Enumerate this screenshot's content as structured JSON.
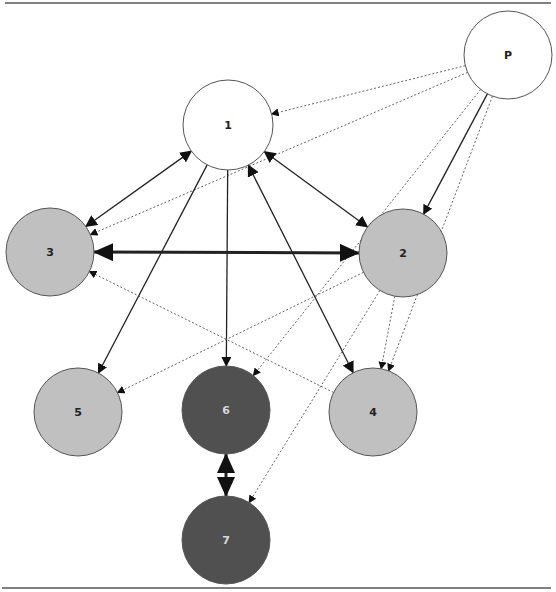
{
  "diagram": {
    "title": "",
    "frame": {
      "top_rule_y": 3,
      "bottom_rule_y": 588,
      "rule_color": "#808080"
    },
    "colors": {
      "white_fill": "#ffffff",
      "light_fill": "#c0c0c0",
      "dark_fill": "#505050",
      "stroke": "#555555",
      "edge": "#222222",
      "dotted_edge": "#666666",
      "light_label": "#222222",
      "dark_label": "#d8d8d8"
    },
    "nodes": [
      {
        "id": "P",
        "label": "P",
        "cx": 508,
        "cy": 55,
        "r": 44,
        "fill": "white"
      },
      {
        "id": "1",
        "label": "1",
        "cx": 228,
        "cy": 125,
        "r": 45,
        "fill": "white"
      },
      {
        "id": "3",
        "label": "3",
        "cx": 50,
        "cy": 252,
        "r": 44,
        "fill": "light"
      },
      {
        "id": "2",
        "label": "2",
        "cx": 403,
        "cy": 253,
        "r": 44,
        "fill": "light"
      },
      {
        "id": "5",
        "label": "5",
        "cx": 78,
        "cy": 412,
        "r": 44,
        "fill": "light"
      },
      {
        "id": "6",
        "label": "6",
        "cx": 226,
        "cy": 410,
        "r": 44,
        "fill": "dark"
      },
      {
        "id": "4",
        "label": "4",
        "cx": 373,
        "cy": 412,
        "r": 44,
        "fill": "light"
      },
      {
        "id": "7",
        "label": "7",
        "cx": 226,
        "cy": 540,
        "r": 44,
        "fill": "dark"
      }
    ],
    "edges": [
      {
        "from": "P",
        "to": "1",
        "style": "dotted",
        "direction": "forward"
      },
      {
        "from": "P",
        "to": "3",
        "style": "dotted",
        "direction": "forward"
      },
      {
        "from": "P",
        "to": "2",
        "style": "solid",
        "direction": "forward"
      },
      {
        "from": "P",
        "to": "6",
        "style": "dotted",
        "direction": "forward"
      },
      {
        "from": "P",
        "to": "4",
        "style": "dotted",
        "direction": "forward"
      },
      {
        "from": "1",
        "to": "3",
        "style": "solid",
        "direction": "both"
      },
      {
        "from": "1",
        "to": "2",
        "style": "solid",
        "direction": "both"
      },
      {
        "from": "3",
        "to": "2",
        "style": "thick",
        "direction": "both"
      },
      {
        "from": "1",
        "to": "5",
        "style": "solid",
        "direction": "forward"
      },
      {
        "from": "1",
        "to": "6",
        "style": "solid",
        "direction": "forward"
      },
      {
        "from": "1",
        "to": "4",
        "style": "solid",
        "direction": "both"
      },
      {
        "from": "2",
        "to": "5",
        "style": "dotted",
        "direction": "forward"
      },
      {
        "from": "2",
        "to": "4",
        "style": "dotted",
        "direction": "forward"
      },
      {
        "from": "2",
        "to": "7",
        "style": "dotted",
        "direction": "forward"
      },
      {
        "from": "4",
        "to": "3",
        "style": "dotted",
        "direction": "forward"
      },
      {
        "from": "6",
        "to": "7",
        "style": "thick",
        "direction": "both"
      }
    ]
  }
}
